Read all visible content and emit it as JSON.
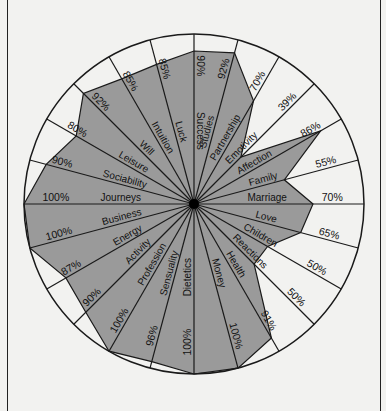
{
  "chart_data": {
    "type": "radar",
    "title": "",
    "start_angle_deg": 0,
    "direction": "clockwise",
    "r_range": [
      0,
      100
    ],
    "unit": "%",
    "categories": [
      "Success",
      "Studies",
      "Partnership",
      "Emotivity",
      "Affection",
      "Family",
      "Marriage",
      "Love",
      "Children",
      "Reactions",
      "Health",
      "Money",
      "Dietetics",
      "Sensuality",
      "Profession",
      "Activity",
      "Energy",
      "Business",
      "Journeys",
      "Sociability",
      "Leisure",
      "Will",
      "Intuition",
      "Luck"
    ],
    "values": [
      90,
      92,
      70,
      39,
      86,
      55,
      70,
      65,
      50,
      50,
      91,
      100,
      100,
      96,
      100,
      90,
      87,
      100,
      100,
      90,
      80,
      92,
      85,
      85
    ],
    "value_labels": [
      "90%",
      "92%",
      "70%",
      "39%",
      "86%",
      "55%",
      "70%",
      "65%",
      "50%",
      "50%",
      "91%",
      "100%",
      "100%",
      "96%",
      "100%",
      "90%",
      "87%",
      "100%",
      "100%",
      "90%",
      "80%",
      "92%",
      "85%",
      "85%"
    ],
    "grid": false,
    "legend": null
  },
  "colors": {
    "fill": "#9a9a9a",
    "background": "#f2f2f0",
    "stroke": "#1a1a1a"
  }
}
